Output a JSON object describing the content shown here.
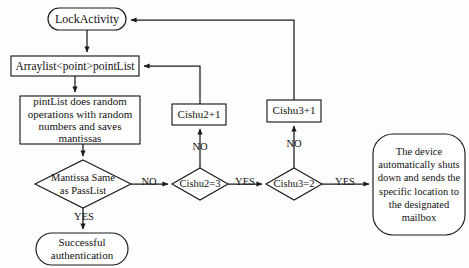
{
  "diagram": {
    "background_color": "#fdfdfd",
    "stroke_color": "#1a1a1a",
    "text_color": "#111111",
    "nodes": {
      "lock_activity": {
        "label": "LockActivity",
        "shape": "terminal-rounded",
        "x": 48,
        "y": 8,
        "w": 78,
        "h": 22
      },
      "arraylist": {
        "label": "Arraylist<point>pointList",
        "shape": "process-rect",
        "x": 11,
        "y": 56,
        "w": 128,
        "h": 20
      },
      "pintlist_process": {
        "label": "pintList does random\noperations with random\nnumbers and saves\nmantissas",
        "shape": "process-rect",
        "x": 20,
        "y": 96,
        "w": 120,
        "h": 48
      },
      "mantissa_decision": {
        "label": "Mantissa Same\nas PassList",
        "shape": "decision-diamond",
        "x": 35,
        "y": 160,
        "w": 96,
        "h": 48
      },
      "successful_auth": {
        "label": "Successful\nauthentication",
        "shape": "terminal-rounded",
        "x": 36,
        "y": 233,
        "w": 92,
        "h": 32
      },
      "cishu2_increment": {
        "label": "Cishu2+1",
        "shape": "process-rect",
        "x": 172,
        "y": 104,
        "w": 54,
        "h": 21
      },
      "cishu2_decision": {
        "label": "Cishu2=3",
        "shape": "decision-diamond",
        "x": 172,
        "y": 168,
        "w": 56,
        "h": 32
      },
      "cishu3_increment": {
        "label": "Cishu3+1",
        "shape": "process-rect",
        "x": 267,
        "y": 100,
        "w": 54,
        "h": 22
      },
      "cishu3_decision": {
        "label": "Cishu3=2",
        "shape": "decision-diamond",
        "x": 266,
        "y": 168,
        "w": 56,
        "h": 32
      },
      "device_shutdown": {
        "label": "The device\nautomatically shuts\ndown and sends the\nspecific location to\nthe designated\nmailbox",
        "shape": "terminal-rounded",
        "x": 373,
        "y": 134,
        "w": 92,
        "h": 101
      }
    },
    "edge_labels": {
      "mantissa_no": "NO",
      "mantissa_yes": "YES",
      "cishu2_no": "NO",
      "cishu2_yes": "YES",
      "cishu3_no": "NO",
      "cishu3_yes": "YES"
    }
  }
}
